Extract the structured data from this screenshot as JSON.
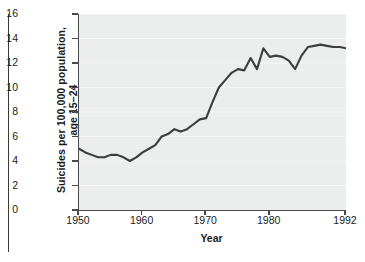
{
  "figure": {
    "background_color": "#ffffff",
    "plot_background_color": "#eceded",
    "line_color": "#3d3d3d",
    "axis_color": "#4a4a4a",
    "text_color": "#1b1b1b"
  },
  "chart_data": {
    "type": "line",
    "title": "",
    "xlabel": "Year",
    "ylabel": "Suicides per 100,000 population,\nage 15–24",
    "xlim": [
      1950,
      1992
    ],
    "ylim": [
      0,
      16
    ],
    "grid": true,
    "legend": "none",
    "xticks": [
      "1950",
      "1960",
      "1970",
      "1980",
      "1992"
    ],
    "xtick_values": [
      1950,
      1960,
      1970,
      1980,
      1992
    ],
    "yticks": [
      "0",
      "2",
      "4",
      "6",
      "8",
      "10",
      "12",
      "14",
      "16"
    ],
    "ytick_values": [
      0,
      2,
      4,
      6,
      8,
      10,
      12,
      14,
      16
    ],
    "x": [
      1950,
      1951,
      1952,
      1953,
      1954,
      1955,
      1956,
      1957,
      1958,
      1959,
      1960,
      1961,
      1962,
      1963,
      1964,
      1965,
      1966,
      1967,
      1968,
      1969,
      1970,
      1971,
      1972,
      1973,
      1974,
      1975,
      1976,
      1977,
      1978,
      1979,
      1980,
      1981,
      1982,
      1983,
      1984,
      1985,
      1986,
      1987,
      1988,
      1989,
      1990,
      1991,
      1992
    ],
    "series": [
      {
        "name": "Suicide rate, age 15–24",
        "values": [
          5.0,
          4.7,
          4.5,
          4.3,
          4.3,
          4.5,
          4.5,
          4.3,
          4.0,
          4.3,
          4.7,
          5.0,
          5.3,
          6.0,
          6.2,
          6.6,
          6.4,
          6.6,
          7.0,
          7.4,
          7.5,
          8.8,
          10.0,
          10.6,
          11.2,
          11.5,
          11.4,
          12.4,
          11.5,
          13.2,
          12.5,
          12.6,
          12.5,
          12.2,
          11.5,
          12.6,
          13.3,
          13.4,
          13.5,
          13.4,
          13.3,
          13.3,
          13.2
        ]
      }
    ]
  }
}
